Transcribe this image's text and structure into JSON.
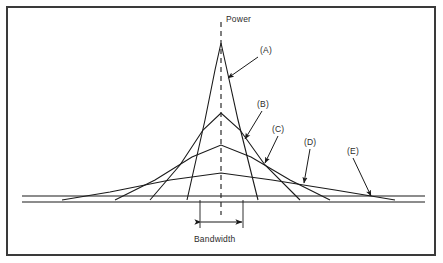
{
  "figure": {
    "axis_label_power": "Power",
    "axis_label_bandwidth": "Bandwidth",
    "callouts": [
      {
        "id": "A",
        "label": "(A)"
      },
      {
        "id": "B",
        "label": "(B)"
      },
      {
        "id": "C",
        "label": "(C)"
      },
      {
        "id": "D",
        "label": "(D)"
      },
      {
        "id": "E",
        "label": "(E)"
      }
    ],
    "colors": {
      "line": "#1a1a1a",
      "frame": "#3a3a3a",
      "text": "#2b2b2b",
      "background": "#ffffff"
    }
  },
  "chart_data": {
    "type": "line",
    "title": "",
    "subtitle": "",
    "xlabel": "Bandwidth",
    "ylabel": "Power",
    "grid": false,
    "legend": "none",
    "xlim": [
      20,
      425
    ],
    "ylim": [
      200,
      40
    ],
    "center_x": 221,
    "baseline_y": 200,
    "annotations": [
      {
        "text": "Power",
        "x": 226,
        "y": 18,
        "role": "axis-label"
      },
      {
        "text": "Bandwidth",
        "x": 194,
        "y": 238,
        "role": "axis-label"
      },
      {
        "text": "(A)",
        "x": 260,
        "y": 49,
        "role": "callout",
        "points_to": "narrowest-tallest-peak"
      },
      {
        "text": "(B)",
        "x": 257,
        "y": 103,
        "role": "callout",
        "points_to": "second-peak-skirt"
      },
      {
        "text": "(C)",
        "x": 272,
        "y": 128,
        "role": "callout",
        "points_to": "third-peak-skirt"
      },
      {
        "text": "(D)",
        "x": 304,
        "y": 141,
        "role": "callout",
        "points_to": "upper-baseline"
      },
      {
        "text": "(E)",
        "x": 347,
        "y": 150,
        "role": "callout",
        "points_to": "lower-baseline"
      }
    ],
    "series": [
      {
        "name": "A",
        "description": "narrowest, tallest spectral peak",
        "peak_x": 221,
        "peak_y": 43,
        "points": [
          [
            187,
            200
          ],
          [
            205,
            120
          ],
          [
            215,
            70
          ],
          [
            221,
            43
          ],
          [
            227,
            70
          ],
          [
            238,
            120
          ],
          [
            258,
            200
          ]
        ]
      },
      {
        "name": "B",
        "description": "second spectral peak, wider and lower",
        "peak_x": 221,
        "peak_y": 113,
        "points": [
          [
            150,
            200
          ],
          [
            180,
            165
          ],
          [
            203,
            130
          ],
          [
            221,
            113
          ],
          [
            240,
            130
          ],
          [
            265,
            165
          ],
          [
            300,
            200
          ]
        ]
      },
      {
        "name": "C",
        "description": "third spectral peak, wider still",
        "peak_x": 221,
        "peak_y": 145,
        "points": [
          [
            115,
            200
          ],
          [
            155,
            180
          ],
          [
            192,
            157
          ],
          [
            221,
            145
          ],
          [
            251,
            157
          ],
          [
            290,
            180
          ],
          [
            330,
            200
          ]
        ]
      },
      {
        "name": "D",
        "description": "widest, lowest spectral peak",
        "peak_x": 221,
        "peak_y": 173,
        "points": [
          [
            62,
            200
          ],
          [
            110,
            192
          ],
          [
            170,
            180
          ],
          [
            221,
            173
          ],
          [
            272,
            180
          ],
          [
            335,
            190
          ],
          [
            395,
            200
          ]
        ]
      },
      {
        "name": "upper-baseline",
        "description": "upper horizontal reference line",
        "points": [
          [
            22,
            196
          ],
          [
            425,
            196
          ]
        ]
      },
      {
        "name": "lower-baseline",
        "description": "lower horizontal reference line",
        "points": [
          [
            22,
            202
          ],
          [
            425,
            202
          ]
        ]
      }
    ],
    "bandwidth_marker": {
      "left_x": 200,
      "right_x": 243,
      "y": 222,
      "tick_top_y": 200,
      "tick_bottom_y": 228
    },
    "center_axis": {
      "style": "dashed",
      "x": 221,
      "y_top": 22,
      "y_bottom": 215
    }
  }
}
